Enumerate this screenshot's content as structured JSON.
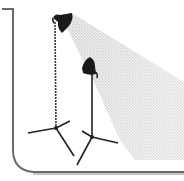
{
  "illustration": {
    "subject": "studio-lights-on-tripods",
    "lights": [
      {
        "name": "tall-light",
        "head_x": 55,
        "head_y": 20,
        "base_x": 56,
        "base_y": 130
      },
      {
        "name": "short-light",
        "head_x": 90,
        "head_y": 68,
        "base_x": 92,
        "base_y": 140
      }
    ],
    "colors": {
      "background": "#ffffff",
      "frame": "#6a6a6a",
      "stand": "#222222",
      "lamp_head": "#1a1a1a",
      "beam": "#d4d4d4"
    }
  }
}
